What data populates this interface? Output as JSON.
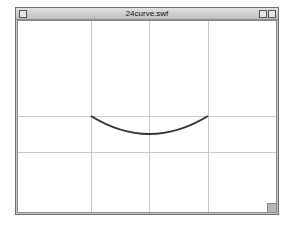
{
  "window": {
    "title": "24curve.swf"
  },
  "icons": {
    "close": "close-box-icon",
    "zoom": "zoom-box-icon",
    "collapse": "collapse-box-icon",
    "grow": "resize-grip-icon"
  },
  "stage": {
    "grid_columns": 4,
    "grid_rows": 3,
    "curve": {
      "type": "quadratic",
      "stroke_color": "#333333",
      "grid_color": "#c9c9c9"
    }
  }
}
